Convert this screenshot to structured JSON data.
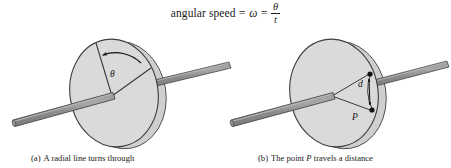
{
  "figure": {
    "equation": {
      "label": "angular speed",
      "equals_1": "=",
      "symbol": "ω",
      "equals_2": "=",
      "numerator": "θ",
      "denominator": "t"
    },
    "panels": [
      {
        "id": "a",
        "caption_label": "(a)",
        "caption_text": "A radial line turns through",
        "angle_label": "θ",
        "arrow_direction": "counterclockwise",
        "object": "rotating disk on axle"
      },
      {
        "id": "b",
        "caption_label": "(b)",
        "caption_text_parts": [
          "The point ",
          "P",
          " travels a distance"
        ],
        "caption_text": "The point P travels a distance",
        "distance_label": "d",
        "point_label": "P",
        "object": "rotating disk on axle"
      }
    ],
    "colors": {
      "disk_face": "#d9d9d9",
      "disk_rim": "#c9c9c9",
      "rod": "#8c8c8c",
      "rod_highlight": "#a6a6a6",
      "outline": "#3a3a3a",
      "text": "#1b1b1b",
      "background": "#ffffff"
    }
  }
}
